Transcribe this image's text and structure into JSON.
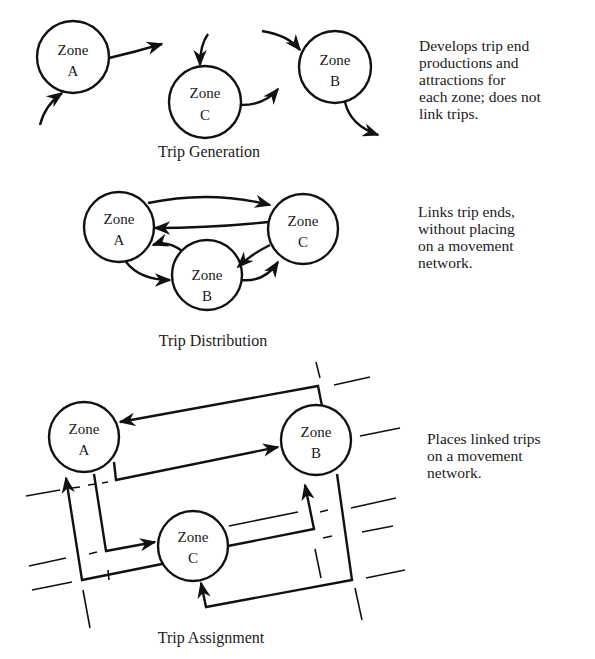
{
  "colors": {
    "ink": "#111111",
    "background": "#ffffff"
  },
  "sections": [
    {
      "caption": "Trip Generation",
      "description": "Develops trip end\nproductions and\nattractions for\neach zone; does not\nlink trips.",
      "zones": [
        {
          "id": "A",
          "line1": "Zone",
          "line2": "A"
        },
        {
          "id": "C",
          "line1": "Zone",
          "line2": "C"
        },
        {
          "id": "B",
          "line1": "Zone",
          "line2": "B"
        }
      ]
    },
    {
      "caption": "Trip Distribution",
      "description": "Links trip ends,\nwithout placing\non a movement\nnetwork.",
      "zones": [
        {
          "id": "A",
          "line1": "Zone",
          "line2": "A"
        },
        {
          "id": "C",
          "line1": "Zone",
          "line2": "C"
        },
        {
          "id": "B",
          "line1": "Zone",
          "line2": "B"
        }
      ]
    },
    {
      "caption": "Trip Assignment",
      "description": "Places linked trips\non a movement\nnetwork.",
      "zones": [
        {
          "id": "A",
          "line1": "Zone",
          "line2": "A"
        },
        {
          "id": "B",
          "line1": "Zone",
          "line2": "B"
        },
        {
          "id": "C",
          "line1": "Zone",
          "line2": "C"
        }
      ]
    }
  ]
}
